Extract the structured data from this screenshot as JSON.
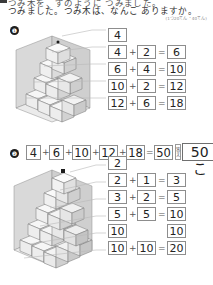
{
  "header": {
    "line1": "つみ木を、ずのように つみました。",
    "line2": "つみました。つみ木は、なんこ ありますか。",
    "points_note": "(1つ20てん・40てん)"
  },
  "sections": [
    {
      "number": "❶",
      "figure_name": "cube-stack-figure-1",
      "equations": [
        {
          "a": "4",
          "op": "",
          "b": "",
          "eq": "",
          "result": ""
        },
        {
          "a": "4",
          "op": "+",
          "b": "2",
          "eq": "=",
          "result": "6"
        },
        {
          "a": "6",
          "op": "+",
          "b": "4",
          "eq": "=",
          "result": "10"
        },
        {
          "a": "10",
          "op": "+",
          "b": "2",
          "eq": "=",
          "result": "12"
        },
        {
          "a": "12",
          "op": "+",
          "b": "6",
          "eq": "=",
          "result": "18"
        }
      ],
      "total": {
        "terms": [
          "4",
          "6",
          "10",
          "12",
          "18"
        ],
        "operator": "+",
        "equals": "=",
        "sum": "50",
        "answer_label": "答え",
        "answer": "50こ"
      }
    },
    {
      "number": "❷",
      "figure_name": "cube-stack-figure-2",
      "equations": [
        {
          "a": "2",
          "op": "",
          "b": "",
          "eq": "",
          "result": ""
        },
        {
          "a": "2",
          "op": "+",
          "b": "1",
          "eq": "=",
          "result": "3"
        },
        {
          "a": "3",
          "op": "+",
          "b": "2",
          "eq": "=",
          "result": "5"
        },
        {
          "a": "5",
          "op": "+",
          "b": "5",
          "eq": "=",
          "result": "10"
        },
        {
          "a": "10",
          "op": "",
          "b": "",
          "eq": "",
          "result": "10"
        },
        {
          "a": "10",
          "op": "+",
          "b": "10",
          "eq": "=",
          "result": "20"
        }
      ],
      "total": {
        "terms": [
          "2",
          "3",
          "5",
          "10",
          "10",
          "20"
        ],
        "operator": "+",
        "equals": "=",
        "sum": "50",
        "answer_label": "答え",
        "answer": "50こ"
      }
    }
  ],
  "colors": {
    "ink": "#2b2b2b",
    "box_border": "#8d8d8d",
    "cube_face_top": "#f7f7f7",
    "cube_face_left": "#ececec",
    "cube_face_right": "#dcdcdc",
    "wall": "#d8d8d8",
    "floor": "#e8e8e8"
  }
}
